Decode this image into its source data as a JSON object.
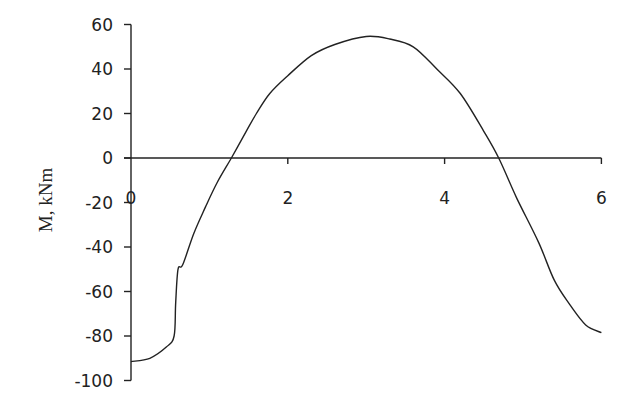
{
  "chart_data": {
    "type": "line",
    "title": "",
    "xlabel": "",
    "ylabel": "M, kNm",
    "xlim": [
      0,
      6
    ],
    "ylim": [
      -100,
      60
    ],
    "x_ticks": [
      0,
      2,
      4,
      6
    ],
    "y_ticks": [
      60,
      40,
      20,
      0,
      -20,
      -40,
      -60,
      -80,
      -100
    ],
    "grid": false,
    "legend": null,
    "series": [
      {
        "name": "M",
        "color": "#222222",
        "x": [
          0,
          0.24,
          0.45,
          0.55,
          0.57,
          0.6,
          0.66,
          0.8,
          0.95,
          1.1,
          1.28,
          1.47,
          1.6,
          1.77,
          2.0,
          2.3,
          2.6,
          3.0,
          3.3,
          3.6,
          3.9,
          4.2,
          4.5,
          4.69,
          4.92,
          5.2,
          5.4,
          5.6,
          5.8,
          6.0
        ],
        "values": [
          -91.5,
          -90,
          -85,
          -80,
          -65,
          -50,
          -48,
          -34,
          -22,
          -11,
          0,
          12,
          20,
          29,
          37,
          46,
          51,
          54.6,
          53.5,
          50,
          40,
          29,
          12,
          0,
          -18,
          -38,
          -55,
          -66,
          -75,
          -78.5
        ]
      }
    ]
  },
  "axes": {
    "x_tick_labels": [
      "0",
      "2",
      "4",
      "6"
    ],
    "y_tick_labels": [
      "60",
      "40",
      "20",
      "0",
      "-20",
      "-40",
      "-60",
      "-80",
      "-100"
    ],
    "y_title": "M, kNm"
  }
}
